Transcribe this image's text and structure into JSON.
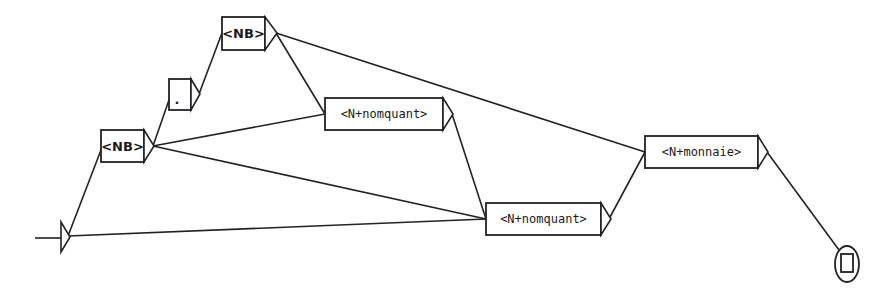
{
  "graph": {
    "title": "",
    "initial_state": {
      "x": 68,
      "y": 237
    },
    "final_state": {
      "x": 847,
      "y": 263
    },
    "nodes": [
      {
        "id": "nb1",
        "label": "<NB>",
        "x": 101,
        "y": 130,
        "w": 43,
        "h": 32
      },
      {
        "id": "dot",
        "label": ".",
        "x": 169,
        "y": 79,
        "w": 22,
        "h": 31
      },
      {
        "id": "nb2",
        "label": "<NB>",
        "x": 222,
        "y": 17,
        "w": 43,
        "h": 33
      },
      {
        "id": "nomquant1",
        "label": "<N+nomquant>",
        "x": 325,
        "y": 98,
        "w": 118,
        "h": 32
      },
      {
        "id": "nomquant2",
        "label": "<N+nomquant>",
        "x": 486,
        "y": 203,
        "w": 115,
        "h": 32
      },
      {
        "id": "monnaie",
        "label": "<N+monnaie>",
        "x": 645,
        "y": 136,
        "w": 113,
        "h": 32
      }
    ],
    "edges": [
      {
        "from": "initial",
        "to": "nb1"
      },
      {
        "from": "initial",
        "to": "nomquant2"
      },
      {
        "from": "nb1",
        "to": "dot"
      },
      {
        "from": "nb1",
        "to": "nomquant1"
      },
      {
        "from": "nb1",
        "to": "nomquant2"
      },
      {
        "from": "dot",
        "to": "nb2"
      },
      {
        "from": "nb2",
        "to": "nomquant1"
      },
      {
        "from": "nb2",
        "to": "monnaie"
      },
      {
        "from": "nomquant1",
        "to": "nomquant2"
      },
      {
        "from": "nomquant2",
        "to": "monnaie"
      },
      {
        "from": "monnaie",
        "to": "final"
      }
    ],
    "colors": {
      "stroke": "#222222",
      "background": "#ffffff"
    }
  }
}
